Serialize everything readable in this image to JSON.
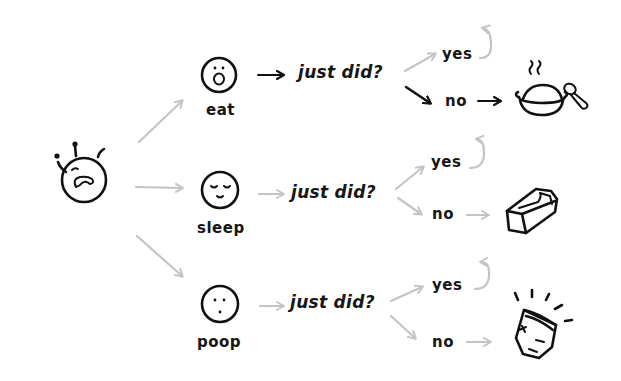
{
  "diagram": {
    "type": "flowchart",
    "style": "hand-drawn",
    "colors": {
      "ink": "#111111",
      "connector": "#c4c4c4",
      "background": "#ffffff"
    },
    "root": {
      "label": "",
      "icon": "crying-baby-face-icon"
    },
    "branches": [
      {
        "id": "eat",
        "label": "eat",
        "face_icon": "surprised-face-icon",
        "question": "just did?",
        "yes_label": "yes",
        "no_label": "no",
        "yes_target": "loop-back",
        "no_target_icon": "food-bowl-spoon-icon"
      },
      {
        "id": "sleep",
        "label": "sleep",
        "face_icon": "sleeping-face-icon",
        "question": "just did?",
        "yes_label": "yes",
        "no_label": "no",
        "yes_target": "loop-back",
        "no_target_icon": "bassinet-icon"
      },
      {
        "id": "poop",
        "label": "poop",
        "face_icon": "neutral-face-icon",
        "question": "just did?",
        "yes_label": "yes",
        "no_label": "no",
        "yes_target": "loop-back",
        "no_target_icon": "diaper-icon"
      }
    ]
  }
}
